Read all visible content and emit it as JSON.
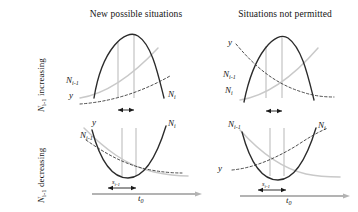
{
  "figure": {
    "columns": [
      {
        "title": "New possible situations"
      },
      {
        "title": "Situations not permitted"
      }
    ],
    "rows": [
      {
        "label_main": "N",
        "label_sub": "i-1",
        "label_tail": " increasing"
      },
      {
        "label_main": "N",
        "label_sub": "i-1",
        "label_tail": " decreasing"
      }
    ],
    "axis": {
      "t0_main": "t",
      "t0_sub": "0",
      "s_main": "s",
      "s_sub": "i-1"
    },
    "panels": [
      {
        "id": "top-left",
        "column": "New possible situations",
        "row": "N_{i-1} increasing",
        "shape": "downward-parabola",
        "labels": [
          {
            "name": "N-prev",
            "main": "N",
            "sub": "i-1"
          },
          {
            "name": "y",
            "main": "y",
            "sub": ""
          },
          {
            "name": "N-curr",
            "main": "N",
            "sub": "i"
          }
        ],
        "has_arrow": true,
        "has_axis": false
      },
      {
        "id": "top-right",
        "column": "Situations not permitted",
        "row": "N_{i-1} increasing",
        "shape": "downward-parabola",
        "labels": [
          {
            "name": "y",
            "main": "y",
            "sub": ""
          },
          {
            "name": "N-prev",
            "main": "N",
            "sub": "i-1"
          },
          {
            "name": "N-curr",
            "main": "N",
            "sub": "i"
          }
        ],
        "has_arrow": true,
        "has_axis": false
      },
      {
        "id": "bottom-left",
        "column": "New possible situations",
        "row": "N_{i-1} decreasing",
        "shape": "upward-parabola",
        "labels": [
          {
            "name": "y",
            "main": "y",
            "sub": ""
          },
          {
            "name": "N-prev",
            "main": "N",
            "sub": "i-1"
          },
          {
            "name": "N-curr",
            "main": "N",
            "sub": "i"
          }
        ],
        "has_arrow": true,
        "has_axis": true
      },
      {
        "id": "bottom-right",
        "column": "Situations not permitted",
        "row": "N_{i-1} decreasing",
        "shape": "upward-parabola",
        "labels": [
          {
            "name": "N-prev",
            "main": "N",
            "sub": "i-1"
          },
          {
            "name": "N-curr",
            "main": "N",
            "sub": "i"
          },
          {
            "name": "y",
            "main": "y",
            "sub": ""
          }
        ],
        "has_arrow": true,
        "has_axis": true
      }
    ],
    "colors": {
      "dark_curve": "#2b2b2b",
      "gray_curve": "#c9c9c9",
      "dashed_curve": "#3a3a3a",
      "guide_line": "#d2d2d2",
      "axis": "#b3b3b3",
      "text": "#141414",
      "background": "#ffffff"
    }
  }
}
